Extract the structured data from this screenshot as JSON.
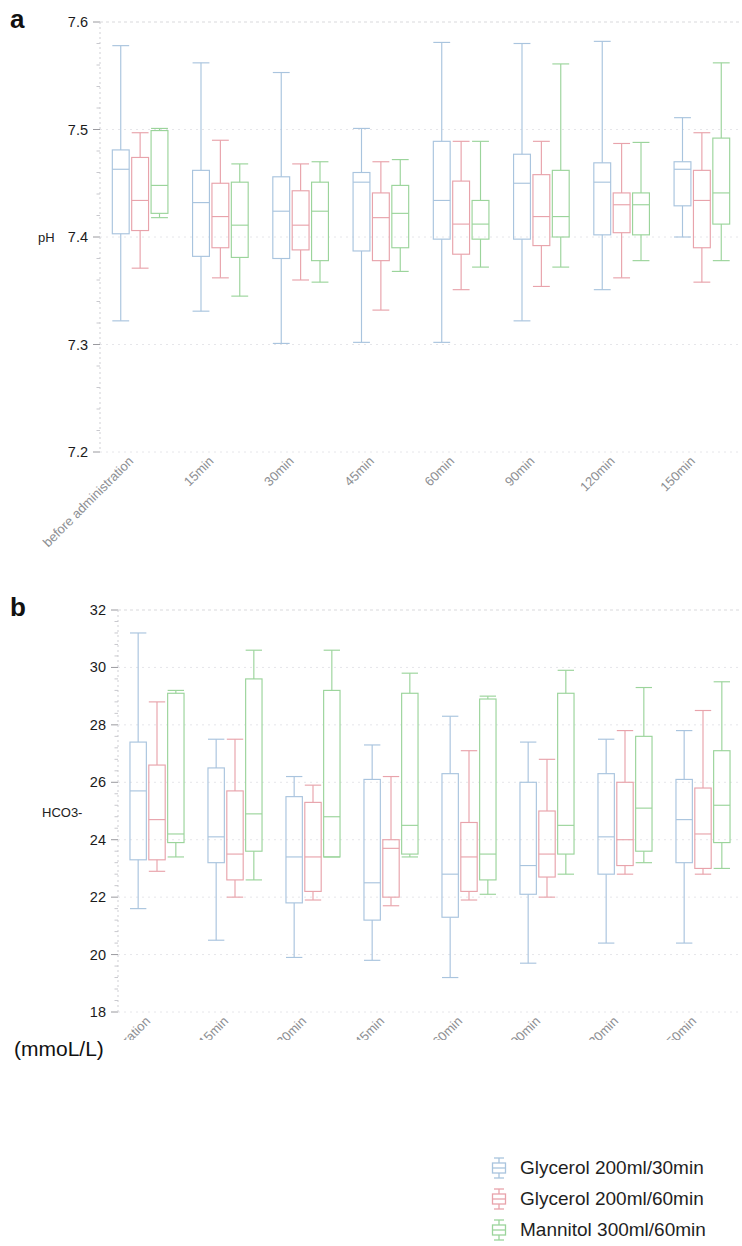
{
  "figure": {
    "panel_a_letter": "a",
    "panel_b_letter": "b",
    "unit_label": "(mmoL/L)"
  },
  "legend": {
    "position": "bottom-right",
    "items": [
      {
        "label": "Glycerol 200ml/30min",
        "color": "#a9c4de"
      },
      {
        "label": "Glycerol 200ml/60min",
        "color": "#e8a3ab"
      },
      {
        "label": "Mannitol 300ml/60min",
        "color": "#9bd49b"
      }
    ]
  },
  "chart_data": [
    {
      "type": "box",
      "panel": "a",
      "title": "",
      "xlabel": "",
      "ylabel": "pH",
      "ylim": [
        7.2,
        7.6
      ],
      "yticks": [
        7.2,
        7.3,
        7.4,
        7.5,
        7.6
      ],
      "ytick_labels": [
        "7.2",
        "7.3",
        "7.4",
        "7.5",
        "7.6"
      ],
      "grid": true,
      "categories": [
        "before administration",
        "15min",
        "30min",
        "45min",
        "60min",
        "90min",
        "120min",
        "150min"
      ],
      "series": [
        {
          "name": "Glycerol 200ml/30min",
          "color": "#a9c4de",
          "boxes": [
            {
              "min": 7.322,
              "q1": 7.403,
              "median": 7.463,
              "q3": 7.481,
              "max": 7.578
            },
            {
              "min": 7.331,
              "q1": 7.382,
              "median": 7.432,
              "q3": 7.462,
              "max": 7.562
            },
            {
              "min": 7.301,
              "q1": 7.38,
              "median": 7.424,
              "q3": 7.456,
              "max": 7.553
            },
            {
              "min": 7.302,
              "q1": 7.387,
              "median": 7.451,
              "q3": 7.46,
              "max": 7.501
            },
            {
              "min": 7.302,
              "q1": 7.398,
              "median": 7.434,
              "q3": 7.489,
              "max": 7.581
            },
            {
              "min": 7.322,
              "q1": 7.398,
              "median": 7.45,
              "q3": 7.477,
              "max": 7.58
            },
            {
              "min": 7.351,
              "q1": 7.402,
              "median": 7.451,
              "q3": 7.469,
              "max": 7.582
            },
            {
              "min": 7.4,
              "q1": 7.429,
              "median": 7.463,
              "q3": 7.47,
              "max": 7.511
            }
          ]
        },
        {
          "name": "Glycerol 200ml/60min",
          "color": "#e8a3ab",
          "boxes": [
            {
              "min": 7.371,
              "q1": 7.406,
              "median": 7.434,
              "q3": 7.474,
              "max": 7.497
            },
            {
              "min": 7.362,
              "q1": 7.39,
              "median": 7.419,
              "q3": 7.45,
              "max": 7.49
            },
            {
              "min": 7.36,
              "q1": 7.388,
              "median": 7.411,
              "q3": 7.443,
              "max": 7.468
            },
            {
              "min": 7.332,
              "q1": 7.378,
              "median": 7.418,
              "q3": 7.441,
              "max": 7.47
            },
            {
              "min": 7.351,
              "q1": 7.384,
              "median": 7.412,
              "q3": 7.452,
              "max": 7.489
            },
            {
              "min": 7.354,
              "q1": 7.392,
              "median": 7.419,
              "q3": 7.458,
              "max": 7.489
            },
            {
              "min": 7.362,
              "q1": 7.404,
              "median": 7.43,
              "q3": 7.441,
              "max": 7.487
            },
            {
              "min": 7.358,
              "q1": 7.39,
              "median": 7.434,
              "q3": 7.462,
              "max": 7.497
            }
          ]
        },
        {
          "name": "Mannitol 300ml/60min",
          "color": "#9bd49b",
          "boxes": [
            {
              "min": 7.418,
              "q1": 7.422,
              "median": 7.448,
              "q3": 7.499,
              "max": 7.501
            },
            {
              "min": 7.345,
              "q1": 7.381,
              "median": 7.411,
              "q3": 7.451,
              "max": 7.468
            },
            {
              "min": 7.358,
              "q1": 7.378,
              "median": 7.424,
              "q3": 7.451,
              "max": 7.47
            },
            {
              "min": 7.368,
              "q1": 7.39,
              "median": 7.422,
              "q3": 7.448,
              "max": 7.472
            },
            {
              "min": 7.372,
              "q1": 7.398,
              "median": 7.412,
              "q3": 7.434,
              "max": 7.489
            },
            {
              "min": 7.372,
              "q1": 7.4,
              "median": 7.419,
              "q3": 7.462,
              "max": 7.561
            },
            {
              "min": 7.378,
              "q1": 7.402,
              "median": 7.43,
              "q3": 7.441,
              "max": 7.488
            },
            {
              "min": 7.378,
              "q1": 7.412,
              "median": 7.441,
              "q3": 7.492,
              "max": 7.562
            }
          ]
        }
      ]
    },
    {
      "type": "box",
      "panel": "b",
      "title": "",
      "xlabel": "",
      "ylabel": "HCO3-",
      "yunit": "(mmoL/L)",
      "ylim": [
        18,
        32
      ],
      "yticks": [
        18,
        20,
        22,
        24,
        26,
        28,
        30,
        32
      ],
      "ytick_labels": [
        "18",
        "20",
        "22",
        "24",
        "26",
        "28",
        "30",
        "32"
      ],
      "grid": true,
      "categories": [
        "before administration",
        "15min",
        "30min",
        "45min",
        "60min",
        "90min",
        "120min",
        "150min"
      ],
      "series": [
        {
          "name": "Glycerol 200ml/30min",
          "color": "#a9c4de",
          "boxes": [
            {
              "min": 21.6,
              "q1": 23.3,
              "median": 25.7,
              "q3": 27.4,
              "max": 31.2
            },
            {
              "min": 20.5,
              "q1": 23.2,
              "median": 24.1,
              "q3": 26.5,
              "max": 27.5
            },
            {
              "min": 19.9,
              "q1": 21.8,
              "median": 23.4,
              "q3": 25.5,
              "max": 26.2
            },
            {
              "min": 19.8,
              "q1": 21.2,
              "median": 22.5,
              "q3": 26.1,
              "max": 27.3
            },
            {
              "min": 19.2,
              "q1": 21.3,
              "median": 22.8,
              "q3": 26.3,
              "max": 28.3
            },
            {
              "min": 19.7,
              "q1": 22.1,
              "median": 23.1,
              "q3": 26.0,
              "max": 27.4
            },
            {
              "min": 20.4,
              "q1": 22.8,
              "median": 24.1,
              "q3": 26.3,
              "max": 27.5
            },
            {
              "min": 20.4,
              "q1": 23.2,
              "median": 24.7,
              "q3": 26.1,
              "max": 27.8
            }
          ]
        },
        {
          "name": "Glycerol 200ml/60min",
          "color": "#e8a3ab",
          "boxes": [
            {
              "min": 22.9,
              "q1": 23.3,
              "median": 24.7,
              "q3": 26.6,
              "max": 28.8
            },
            {
              "min": 22.0,
              "q1": 22.6,
              "median": 23.5,
              "q3": 25.7,
              "max": 27.5
            },
            {
              "min": 21.9,
              "q1": 22.2,
              "median": 23.4,
              "q3": 25.3,
              "max": 25.9
            },
            {
              "min": 21.7,
              "q1": 22.0,
              "median": 23.7,
              "q3": 24.0,
              "max": 26.2
            },
            {
              "min": 21.9,
              "q1": 22.2,
              "median": 23.4,
              "q3": 24.6,
              "max": 27.1
            },
            {
              "min": 22.0,
              "q1": 22.7,
              "median": 23.5,
              "q3": 25.0,
              "max": 26.8
            },
            {
              "min": 22.8,
              "q1": 23.1,
              "median": 24.0,
              "q3": 26.0,
              "max": 27.8
            },
            {
              "min": 22.8,
              "q1": 23.0,
              "median": 24.2,
              "q3": 25.8,
              "max": 28.5
            }
          ]
        },
        {
          "name": "Mannitol 300ml/60min",
          "color": "#9bd49b",
          "boxes": [
            {
              "min": 23.4,
              "q1": 23.9,
              "median": 24.2,
              "q3": 29.1,
              "max": 29.2
            },
            {
              "min": 22.6,
              "q1": 23.6,
              "median": 24.9,
              "q3": 29.6,
              "max": 30.6
            },
            {
              "min": 23.4,
              "q1": 23.4,
              "median": 24.8,
              "q3": 29.2,
              "max": 30.6
            },
            {
              "min": 23.4,
              "q1": 23.5,
              "median": 24.5,
              "q3": 29.1,
              "max": 29.8
            },
            {
              "min": 22.1,
              "q1": 22.6,
              "median": 23.5,
              "q3": 28.9,
              "max": 29.0
            },
            {
              "min": 22.8,
              "q1": 23.5,
              "median": 24.5,
              "q3": 29.1,
              "max": 29.9
            },
            {
              "min": 23.2,
              "q1": 23.6,
              "median": 25.1,
              "q3": 27.6,
              "max": 29.3
            },
            {
              "min": 23.0,
              "q1": 23.9,
              "median": 25.2,
              "q3": 27.1,
              "max": 29.5
            }
          ]
        }
      ]
    }
  ]
}
